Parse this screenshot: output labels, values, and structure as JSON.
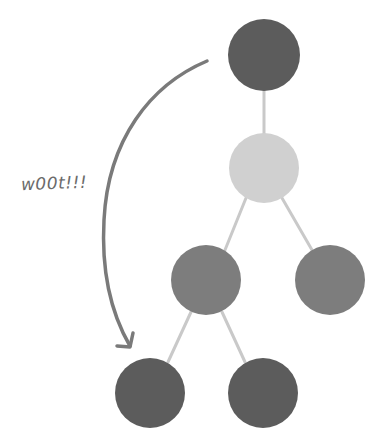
{
  "diagram": {
    "type": "binary-tree",
    "annotation": {
      "text": "w00t!!!",
      "color": "#6b6b6b"
    },
    "colors": {
      "dark": "#5c5c5c",
      "medium": "#7d7d7d",
      "light": "#d0d0d0",
      "edge": "#c9c9c9",
      "arrow": "#7a7a7a"
    },
    "nodes": [
      {
        "id": "root",
        "cx": 264,
        "cy": 55,
        "r": 36,
        "shade": "dark"
      },
      {
        "id": "level1",
        "cx": 264,
        "cy": 168,
        "r": 35,
        "shade": "light"
      },
      {
        "id": "level2-left",
        "cx": 206,
        "cy": 280,
        "r": 35,
        "shade": "medium"
      },
      {
        "id": "level2-right",
        "cx": 330,
        "cy": 280,
        "r": 35,
        "shade": "medium"
      },
      {
        "id": "level3-left",
        "cx": 150,
        "cy": 393,
        "r": 35,
        "shade": "dark"
      },
      {
        "id": "level3-right",
        "cx": 263,
        "cy": 393,
        "r": 35,
        "shade": "dark"
      }
    ],
    "edges": [
      {
        "from": "root",
        "to": "level1"
      },
      {
        "from": "level1",
        "to": "level2-left"
      },
      {
        "from": "level1",
        "to": "level2-right"
      },
      {
        "from": "level2-left",
        "to": "level3-left"
      },
      {
        "from": "level2-left",
        "to": "level3-right"
      }
    ],
    "arrow": {
      "from": "root",
      "to": "level3-left",
      "direction": "curved-down-left"
    }
  }
}
